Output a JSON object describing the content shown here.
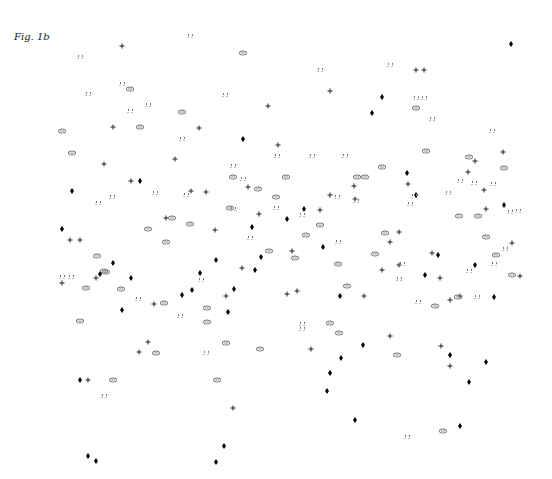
{
  "figure": {
    "label": "Fig. 1b"
  },
  "chart_data": {
    "type": "scatter",
    "title": "Fig. 1b",
    "xlabel": "",
    "ylabel": "",
    "axes_visible": false,
    "grid": false,
    "legend": null,
    "coordinate_note": "pixel positions in 552x479 frame (no axes shown)",
    "series": [
      {
        "name": "diamond",
        "marker": "filled-diamond",
        "color": "#000000",
        "points": [
          [
            511,
            44
          ],
          [
            382,
            97
          ],
          [
            372,
            113
          ],
          [
            243,
            139
          ],
          [
            72,
            191
          ],
          [
            407,
            173
          ],
          [
            416,
            195
          ],
          [
            140,
            181
          ],
          [
            304,
            209
          ],
          [
            252,
            227
          ],
          [
            287,
            219
          ],
          [
            504,
            205
          ],
          [
            62,
            229
          ],
          [
            323,
            247
          ],
          [
            261,
            257
          ],
          [
            475,
            265
          ],
          [
            113,
            263
          ],
          [
            100,
            274
          ],
          [
            131,
            278
          ],
          [
            425,
            275
          ],
          [
            200,
            273
          ],
          [
            216,
            260
          ],
          [
            192,
            290
          ],
          [
            182,
            295
          ],
          [
            234,
            289
          ],
          [
            340,
            296
          ],
          [
            494,
            297
          ],
          [
            122,
            310
          ],
          [
            228,
            312
          ],
          [
            363,
            345
          ],
          [
            341,
            358
          ],
          [
            486,
            362
          ],
          [
            450,
            355
          ],
          [
            330,
            373
          ],
          [
            327,
            391
          ],
          [
            469,
            382
          ],
          [
            80,
            380
          ],
          [
            355,
            420
          ],
          [
            460,
            426
          ],
          [
            224,
            446
          ],
          [
            216,
            462
          ],
          [
            88,
            456
          ],
          [
            96,
            461
          ],
          [
            438,
            255
          ],
          [
            255,
            270
          ]
        ]
      },
      {
        "name": "plus",
        "marker": "plus",
        "color": "#222222",
        "points": [
          [
            122,
            46
          ],
          [
            330,
            91
          ],
          [
            416,
            70
          ],
          [
            424,
            70
          ],
          [
            268,
            106
          ],
          [
            113,
            127
          ],
          [
            199,
            128
          ],
          [
            278,
            145
          ],
          [
            104,
            164
          ],
          [
            175,
            159
          ],
          [
            131,
            181
          ],
          [
            191,
            191
          ],
          [
            206,
            192
          ],
          [
            248,
            187
          ],
          [
            330,
            195
          ],
          [
            354,
            186
          ],
          [
            408,
            184
          ],
          [
            475,
            161
          ],
          [
            503,
            152
          ],
          [
            166,
            218
          ],
          [
            215,
            230
          ],
          [
            259,
            214
          ],
          [
            320,
            210
          ],
          [
            355,
            199
          ],
          [
            484,
            190
          ],
          [
            486,
            209
          ],
          [
            70,
            240
          ],
          [
            80,
            240
          ],
          [
            390,
            242
          ],
          [
            62,
            283
          ],
          [
            96,
            278
          ],
          [
            242,
            268
          ],
          [
            292,
            251
          ],
          [
            382,
            270
          ],
          [
            399,
            265
          ],
          [
            432,
            253
          ],
          [
            512,
            243
          ],
          [
            520,
            276
          ],
          [
            460,
            296
          ],
          [
            450,
            300
          ],
          [
            287,
            294
          ],
          [
            297,
            291
          ],
          [
            364,
            296
          ],
          [
            154,
            304
          ],
          [
            226,
            296
          ],
          [
            311,
            349
          ],
          [
            390,
            336
          ],
          [
            441,
            346
          ],
          [
            450,
            366
          ],
          [
            139,
            352
          ],
          [
            148,
            342
          ],
          [
            88,
            380
          ],
          [
            233,
            408
          ],
          [
            468,
            172
          ],
          [
            399,
            232
          ],
          [
            440,
            278
          ]
        ]
      },
      {
        "name": "oval",
        "marker": "ellipse",
        "color": "#777777",
        "points": [
          [
            243,
            53
          ],
          [
            130,
            89
          ],
          [
            182,
            112
          ],
          [
            140,
            127
          ],
          [
            62,
            131
          ],
          [
            72,
            153
          ],
          [
            426,
            151
          ],
          [
            416,
            108
          ],
          [
            382,
            167
          ],
          [
            357,
            177
          ],
          [
            365,
            177
          ],
          [
            469,
            157
          ],
          [
            504,
            168
          ],
          [
            233,
            177
          ],
          [
            286,
            177
          ],
          [
            258,
            189
          ],
          [
            276,
            197
          ],
          [
            172,
            218
          ],
          [
            190,
            224
          ],
          [
            148,
            229
          ],
          [
            166,
            242
          ],
          [
            320,
            225
          ],
          [
            269,
            251
          ],
          [
            295,
            258
          ],
          [
            338,
            264
          ],
          [
            385,
            233
          ],
          [
            375,
            254
          ],
          [
            459,
            216
          ],
          [
            478,
            216
          ],
          [
            486,
            237
          ],
          [
            496,
            255
          ],
          [
            512,
            275
          ],
          [
            97,
            256
          ],
          [
            106,
            272
          ],
          [
            86,
            288
          ],
          [
            121,
            289
          ],
          [
            207,
            308
          ],
          [
            104,
            271
          ],
          [
            164,
            303
          ],
          [
            458,
            297
          ],
          [
            435,
            306
          ],
          [
            347,
            286
          ],
          [
            80,
            321
          ],
          [
            207,
            322
          ],
          [
            226,
            343
          ],
          [
            260,
            349
          ],
          [
            330,
            323
          ],
          [
            339,
            333
          ],
          [
            156,
            353
          ],
          [
            397,
            355
          ],
          [
            113,
            380
          ],
          [
            217,
            380
          ],
          [
            443,
            431
          ],
          [
            306,
            235
          ],
          [
            230,
            208
          ]
        ]
      },
      {
        "name": "hash",
        "marker": "double-dot",
        "color": "#777777",
        "points": [
          [
            80,
            57
          ],
          [
            190,
            36
          ],
          [
            88,
            94
          ],
          [
            122,
            84
          ],
          [
            130,
            111
          ],
          [
            148,
            105
          ],
          [
            225,
            95
          ],
          [
            320,
            70
          ],
          [
            390,
            65
          ],
          [
            416,
            98
          ],
          [
            424,
            98
          ],
          [
            432,
            119
          ],
          [
            182,
            139
          ],
          [
            277,
            156
          ],
          [
            312,
            156
          ],
          [
            345,
            156
          ],
          [
            233,
            166
          ],
          [
            243,
            179
          ],
          [
            186,
            195
          ],
          [
            155,
            193
          ],
          [
            98,
            203
          ],
          [
            112,
            197
          ],
          [
            233,
            209
          ],
          [
            276,
            208
          ],
          [
            302,
            215
          ],
          [
            337,
            197
          ],
          [
            356,
            201
          ],
          [
            410,
            204
          ],
          [
            414,
            196
          ],
          [
            448,
            193
          ],
          [
            460,
            181
          ],
          [
            492,
            131
          ],
          [
            493,
            184
          ],
          [
            474,
            183
          ],
          [
            510,
            212
          ],
          [
            518,
            211
          ],
          [
            505,
            249
          ],
          [
            250,
            238
          ],
          [
            338,
            242
          ],
          [
            399,
            279
          ],
          [
            402,
            264
          ],
          [
            62,
            277
          ],
          [
            71,
            277
          ],
          [
            138,
            299
          ],
          [
            201,
            280
          ],
          [
            302,
            324
          ],
          [
            302,
            329
          ],
          [
            180,
            316
          ],
          [
            206,
            353
          ],
          [
            418,
            302
          ],
          [
            469,
            271
          ],
          [
            477,
            297
          ],
          [
            104,
            396
          ],
          [
            407,
            437
          ],
          [
            494,
            264
          ]
        ]
      }
    ]
  }
}
